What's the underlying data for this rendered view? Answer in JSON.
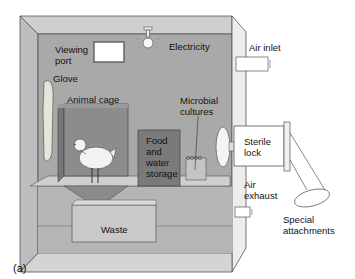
{
  "figure_label": "(a)",
  "labels": {
    "viewing_port_line1": "Viewing",
    "viewing_port_line2": "port",
    "electricity": "Electricity",
    "air_inlet": "Air inlet",
    "glove": "Glove",
    "animal_cage": "Animal cage",
    "microbial_line1": "Microbial",
    "microbial_line2": "cultures",
    "food_line1": "Food",
    "food_line2": "and",
    "food_line3": "water",
    "food_line4": "storage",
    "sterile_line1": "Sterile",
    "sterile_line2": "lock",
    "air_exhaust_line1": "Air",
    "air_exhaust_line2": "exhaust",
    "waste": "Waste",
    "special_line1": "Special",
    "special_line2": "attachments"
  },
  "colors": {
    "wall_back": "#a9a9a9",
    "wall_top": "#cfcfcf",
    "wall_side": "#bdbdbd",
    "cage": "#8c8c8c",
    "food_box": "#7a7a7a",
    "floor": "#c8c8c8",
    "outline": "#555555"
  }
}
